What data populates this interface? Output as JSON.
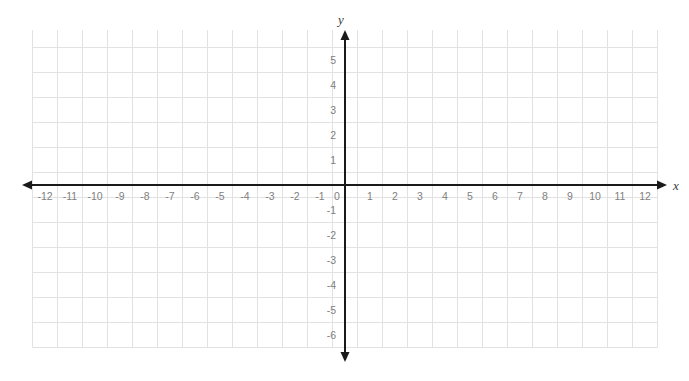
{
  "figure": {
    "title": "",
    "background_color": "#ffffff"
  },
  "chart_data": {
    "type": "scatter",
    "title": "",
    "subtitle": "",
    "xlabel": "x",
    "ylabel": "y",
    "xlim": [
      -12.5,
      12.5
    ],
    "ylim": [
      -6.5,
      6.2
    ],
    "x_ticks": [
      -12,
      -11,
      -10,
      -9,
      -8,
      -7,
      -6,
      -5,
      -4,
      -3,
      -2,
      -1,
      0,
      1,
      2,
      3,
      4,
      5,
      6,
      7,
      8,
      9,
      10,
      11,
      12
    ],
    "y_ticks": [
      5,
      4,
      3,
      2,
      1,
      -1,
      -2,
      -3,
      -4,
      -5,
      -6
    ],
    "x_tick_labels": [
      "-12",
      "-11",
      "-10",
      "-9",
      "-8",
      "-7",
      "-6",
      "-5",
      "-4",
      "-3",
      "-2",
      "-1",
      "0",
      "1",
      "2",
      "3",
      "4",
      "5",
      "6",
      "7",
      "8",
      "9",
      "10",
      "11",
      "12"
    ],
    "y_tick_labels": [
      "5",
      "4",
      "3",
      "2",
      "1",
      "-1",
      "-2",
      "-3",
      "-4",
      "-5",
      "-6"
    ],
    "origin_label": "0",
    "grid": true,
    "grid_spacing": 1,
    "grid_color": "#e2e2e2",
    "axis_color": "#1a1a1a",
    "tick_label_color": "#808080",
    "legend": null,
    "series": [],
    "annotations": []
  },
  "axes": {
    "x_axis_name": "x",
    "y_axis_name": "y"
  }
}
